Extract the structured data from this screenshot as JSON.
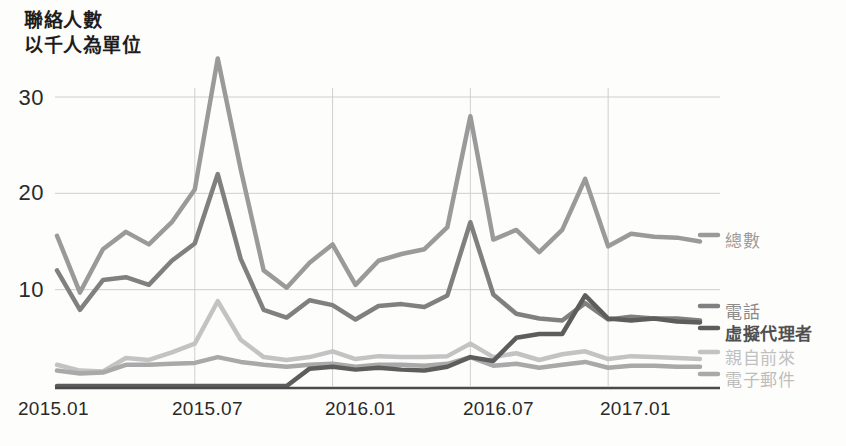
{
  "title": {
    "line1": "聯絡人數",
    "line2": "以千人為單位"
  },
  "axis": {
    "y_ticks": [
      "30",
      "20",
      "10"
    ],
    "x_ticks": [
      "2015.01",
      "2015.07",
      "2016.01",
      "2016.07",
      "2017.01"
    ]
  },
  "legend": {
    "total": "總數",
    "phone": "電話",
    "virtual_agent": "虛擬代理者",
    "in_person": "親自前來",
    "email": "電子郵件"
  },
  "colors": {
    "total": "#9a9a9a",
    "phone": "#808080",
    "virtual_agent": "#5d5d5d",
    "in_person": "#c3c3c3",
    "email": "#a9a9a9",
    "grid": "#cfcfcf",
    "axis": "#4a4a4a",
    "text": "#2a2a2a",
    "legend_total": "#9a9a9a",
    "legend_phone": "#8a8a8a",
    "legend_virtual": "#5d5d5d",
    "legend_in_person": "#c0c0c0",
    "legend_email": "#bdbdbd"
  },
  "chart_data": {
    "type": "line",
    "title": "聯絡人數 以千人為單位",
    "xlabel": "",
    "ylabel": "以千人為單位",
    "ylim": [
      0,
      35
    ],
    "yticks": [
      10,
      20,
      30
    ],
    "grid": true,
    "legend_position": "right",
    "x": [
      "2015.01",
      "2015.02",
      "2015.03",
      "2015.04",
      "2015.05",
      "2015.06",
      "2015.07",
      "2015.08",
      "2015.09",
      "2015.10",
      "2015.11",
      "2015.12",
      "2016.01",
      "2016.02",
      "2016.03",
      "2016.04",
      "2016.05",
      "2016.06",
      "2016.07",
      "2016.08",
      "2016.09",
      "2016.10",
      "2016.11",
      "2016.12",
      "2017.01",
      "2017.02",
      "2017.03",
      "2017.04",
      "2017.05"
    ],
    "series": [
      {
        "name": "總數",
        "color": "#9a9a9a",
        "values": [
          15.6,
          9.7,
          14.2,
          16.0,
          14.7,
          17.0,
          20.4,
          34.0,
          22.5,
          12.0,
          10.2,
          12.8,
          14.7,
          10.5,
          13.0,
          13.7,
          14.2,
          16.5,
          28.0,
          15.2,
          16.2,
          13.9,
          16.2,
          21.5,
          14.5,
          15.8,
          15.5,
          15.4,
          15.0
        ]
      },
      {
        "name": "電話",
        "color": "#808080",
        "values": [
          12.0,
          7.9,
          11.0,
          11.3,
          10.5,
          13.0,
          14.8,
          22.0,
          13.2,
          7.9,
          7.1,
          8.9,
          8.4,
          6.9,
          8.3,
          8.5,
          8.2,
          9.4,
          17.0,
          9.5,
          7.5,
          7.0,
          6.8,
          8.6,
          6.9,
          7.2,
          7.0,
          7.0,
          6.8
        ]
      },
      {
        "name": "虛擬代理者",
        "color": "#5d5d5d",
        "values": [
          0,
          0,
          0,
          0,
          0,
          0,
          0,
          0,
          0,
          0,
          0,
          1.8,
          2.0,
          1.7,
          1.9,
          1.7,
          1.6,
          2.0,
          3.0,
          2.6,
          5.0,
          5.4,
          5.4,
          9.4,
          7.0,
          6.8,
          7.0,
          6.7,
          6.6
        ]
      },
      {
        "name": "親自前來",
        "color": "#c3c3c3",
        "values": [
          2.2,
          1.6,
          1.5,
          2.9,
          2.7,
          3.5,
          4.4,
          8.8,
          4.8,
          3.0,
          2.7,
          3.0,
          3.6,
          2.8,
          3.1,
          3.0,
          3.0,
          3.1,
          4.4,
          3.0,
          3.4,
          2.7,
          3.3,
          3.6,
          2.8,
          3.1,
          3.0,
          2.9,
          2.8
        ]
      },
      {
        "name": "電子郵件",
        "color": "#a9a9a9",
        "values": [
          1.6,
          1.3,
          1.4,
          2.2,
          2.2,
          2.3,
          2.4,
          3.0,
          2.5,
          2.2,
          2.0,
          2.2,
          2.3,
          2.0,
          2.2,
          2.2,
          2.1,
          2.3,
          3.0,
          2.1,
          2.3,
          1.9,
          2.2,
          2.5,
          1.9,
          2.1,
          2.1,
          2.0,
          2.0
        ]
      }
    ]
  }
}
